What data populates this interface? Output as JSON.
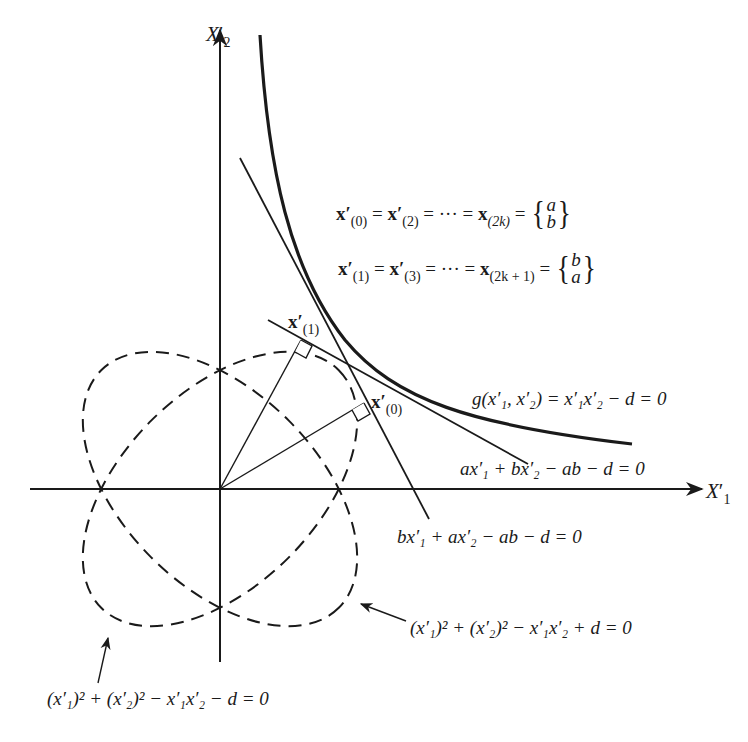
{
  "axes": {
    "x_label": {
      "base": "X",
      "prime": "′",
      "sub": "1"
    },
    "y_label": {
      "base": "X",
      "prime": "′",
      "sub": "2"
    }
  },
  "equations": {
    "even_iterates": {
      "t1": "x",
      "s1": "(0)",
      "t2": "x",
      "s2": "(2)",
      "dots": "= ··· =",
      "t3": "x",
      "s3": "(2k)",
      "eq": "=",
      "top": "a",
      "bottom": "b"
    },
    "odd_iterates": {
      "t1": "x",
      "s1": "(1)",
      "t2": "x",
      "s2": "(3)",
      "dots": "= ··· =",
      "t3": "x",
      "s3": "(2k + 1)",
      "eq": "=",
      "top": "b",
      "bottom": "a"
    },
    "constraint": "g(x′₁, x′₂) = x′₁x′₂ − d = 0",
    "tangent_a": "ax′₁ + bx′₂ − ab − d = 0",
    "tangent_b": "bx′₁ + ax′₂ − ab − d = 0",
    "ellipse_plus": "(x′₁)² + (x′₂)² − x′₁x′₂ + d = 0",
    "ellipse_minus": "(x′₁)² + (x′₂)² − x′₁x′₂ − d = 0"
  },
  "points": {
    "x1_label": {
      "base": "x",
      "prime": "′",
      "sub": "(1)"
    },
    "x0_label": {
      "base": "x",
      "prime": "′",
      "sub": "(0)"
    }
  },
  "colors": {
    "ink": "#1a1a1a",
    "background": "#ffffff"
  }
}
